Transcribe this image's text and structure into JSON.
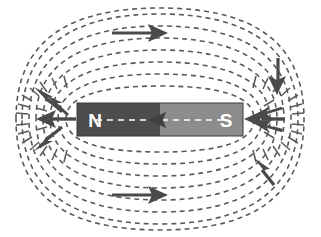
{
  "figure": {
    "background_color": "#ffffff",
    "width": 321,
    "height": 237
  },
  "magnet": {
    "north_label": "N",
    "south_label": "S",
    "north_color": "#4c4c4c",
    "south_color": "#8c8c8c",
    "label_color": "#ffffff",
    "border_color": "#3a3a3a",
    "x": 77,
    "y": 103,
    "width": 166,
    "height": 33,
    "pole_boundary_x": 160
  },
  "field": {
    "line_color": "#5a5a5a",
    "line_style": "dashed",
    "dash_pattern": "5,4",
    "line_width": 1.6,
    "loop_count": 7,
    "center_x": 160,
    "center_y": 119.5
  },
  "arrows": {
    "color": "#4a4a4a",
    "items": [
      {
        "name": "top-field-arrow",
        "direction": "right",
        "x": 118,
        "y": 33,
        "length": 50
      },
      {
        "name": "bottom-field-arrow",
        "direction": "right",
        "x": 118,
        "y": 195,
        "length": 50
      },
      {
        "name": "right-upper-arrow",
        "direction": "down",
        "x": 275,
        "y": 62,
        "length": 32
      },
      {
        "name": "right-lower-arrow",
        "direction": "up-left",
        "x": 262,
        "y": 175,
        "length": 30
      },
      {
        "name": "north-pole-arrow-upper",
        "direction": "up-left"
      },
      {
        "name": "north-pole-arrow-mid",
        "direction": "left"
      },
      {
        "name": "north-pole-arrow-lower",
        "direction": "down-left"
      },
      {
        "name": "south-pole-arrow-in",
        "direction": "left"
      },
      {
        "name": "internal-arrow",
        "direction": "left",
        "x": 152,
        "y": 120
      }
    ]
  },
  "internal_line": {
    "name": "internal-field-line",
    "color": "#ffffff",
    "y": 120,
    "x_start": 96,
    "x_end": 228
  }
}
